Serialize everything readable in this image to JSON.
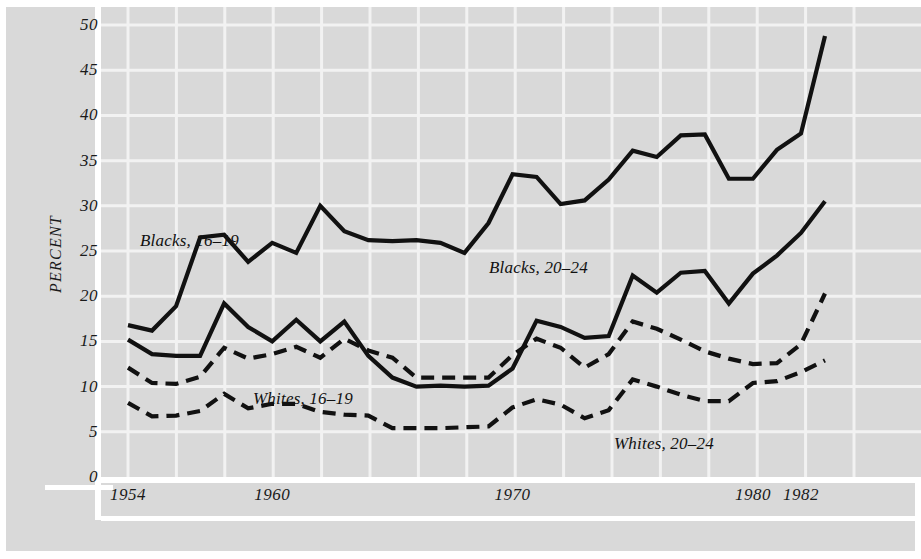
{
  "chart_data": {
    "type": "line",
    "title": "",
    "xlabel": "",
    "ylabel": "PERCENT",
    "xlim": [
      1954,
      1983
    ],
    "ylim": [
      0,
      52
    ],
    "yticks": [
      0,
      5,
      10,
      15,
      20,
      25,
      30,
      35,
      40,
      45,
      50
    ],
    "xticks": [
      1954,
      1960,
      1970,
      1980,
      1982
    ],
    "xtick_labels": [
      "1954",
      "1960",
      "1970",
      "1980",
      "1982"
    ],
    "grid": true,
    "legend_position": "inline-annotations",
    "x": [
      1954,
      1955,
      1956,
      1957,
      1958,
      1959,
      1960,
      1961,
      1962,
      1963,
      1964,
      1965,
      1966,
      1967,
      1968,
      1969,
      1970,
      1971,
      1972,
      1973,
      1974,
      1975,
      1976,
      1977,
      1978,
      1979,
      1980,
      1981,
      1982,
      1983
    ],
    "series": [
      {
        "name": "Blacks, 16-19",
        "label": "Blacks, 16–19",
        "style": "solid",
        "color": "#111111",
        "values": [
          16.8,
          16.2,
          18.9,
          26.5,
          26.8,
          23.8,
          25.9,
          24.8,
          30.0,
          27.2,
          26.2,
          26.1,
          26.2,
          25.9,
          24.8,
          28.1,
          33.5,
          33.2,
          30.2,
          30.6,
          32.9,
          36.1,
          35.4,
          37.8,
          37.9,
          33.0,
          33.0,
          36.2,
          38.0,
          48.8
        ]
      },
      {
        "name": "Blacks, 20-24",
        "label": "Blacks, 20–24",
        "style": "solid",
        "color": "#111111",
        "values": [
          15.2,
          13.6,
          13.4,
          13.4,
          19.2,
          16.6,
          15.0,
          17.4,
          15.0,
          17.2,
          13.4,
          11.0,
          10.0,
          10.1,
          10.0,
          10.1,
          12.0,
          17.3,
          16.6,
          15.4,
          15.6,
          22.3,
          20.4,
          22.6,
          22.8,
          19.2,
          22.5,
          24.5,
          27.0,
          30.5
        ]
      },
      {
        "name": "Whites, 16-19",
        "label": "Whites, 16–19",
        "style": "dashed",
        "color": "#111111",
        "values": [
          12.1,
          10.4,
          10.3,
          11.1,
          14.3,
          13.1,
          13.6,
          14.4,
          13.2,
          15.3,
          14.0,
          13.2,
          11.0,
          11.0,
          11.0,
          11.0,
          13.5,
          15.3,
          14.3,
          12.1,
          13.6,
          17.2,
          16.4,
          15.2,
          13.9,
          13.1,
          12.5,
          12.6,
          14.7,
          20.3
        ]
      },
      {
        "name": "Whites, 20-24",
        "label": "Whites, 20–24",
        "style": "dashed",
        "color": "#111111",
        "values": [
          8.2,
          6.7,
          6.8,
          7.3,
          9.2,
          7.6,
          8.1,
          8.1,
          7.2,
          6.9,
          6.8,
          5.4,
          5.4,
          5.4,
          5.5,
          5.6,
          7.7,
          8.6,
          8.0,
          6.5,
          7.4,
          10.8,
          10.0,
          9.1,
          8.4,
          8.4,
          10.4,
          10.6,
          11.6,
          12.9
        ]
      }
    ],
    "annotations": [
      {
        "text": "Blacks, 16–19",
        "x_px": 140,
        "y_px": 231
      },
      {
        "text": "Blacks, 20–24",
        "x_px": 489,
        "y_px": 258
      },
      {
        "text": "Whites, 16–19",
        "x_px": 253,
        "y_px": 389
      },
      {
        "text": "Whites, 20–24",
        "x_px": 614,
        "y_px": 434
      }
    ]
  },
  "axis": {
    "ylabel": "PERCENT",
    "ytick_labels": [
      "50",
      "45",
      "40",
      "35",
      "30",
      "25",
      "20",
      "15",
      "10",
      "5",
      "0"
    ],
    "xtick_labels": [
      "1954",
      "1960",
      "1970",
      "1980",
      "1982"
    ]
  },
  "colors": {
    "background": "#d9d9d9",
    "grid": "#f2f2f2",
    "line": "#111111",
    "text": "#1a1a1a",
    "page": "#ffffff"
  }
}
